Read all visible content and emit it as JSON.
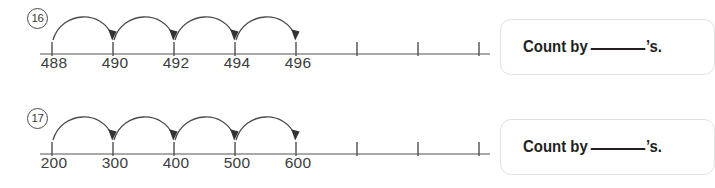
{
  "page": {
    "background_color": "#ffffff",
    "line_color": "#8c8c8c",
    "ink_color": "#231f20"
  },
  "problems": [
    {
      "number_label": "16",
      "number_line": {
        "labeled_values": [
          "488",
          "490",
          "492",
          "494",
          "496"
        ],
        "total_ticks": 8,
        "unlabeled_ticks": 3,
        "hop_count": 4,
        "step": 2
      },
      "prompt": {
        "prefix": "Count by",
        "blank": "",
        "suffix": "’s."
      }
    },
    {
      "number_label": "17",
      "number_line": {
        "labeled_values": [
          "200",
          "300",
          "400",
          "500",
          "600"
        ],
        "total_ticks": 8,
        "unlabeled_ticks": 3,
        "hop_count": 4,
        "step": 100
      },
      "prompt": {
        "prefix": "Count by",
        "blank": "",
        "suffix": "’s."
      }
    }
  ]
}
